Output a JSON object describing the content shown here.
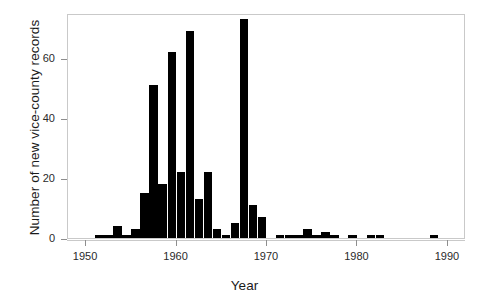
{
  "chart_data": {
    "type": "bar",
    "title": "",
    "xlabel": "Year",
    "ylabel": "Number of new vice-county records",
    "xlim": [
      1948,
      1992
    ],
    "ylim": [
      0,
      75
    ],
    "xticks": [
      1950,
      1960,
      1970,
      1980,
      1990
    ],
    "xtick_labels": [
      "1950",
      "1960",
      "1970",
      "1980",
      "1990"
    ],
    "yticks": [
      0,
      20,
      40,
      60
    ],
    "ytick_labels": [
      "0",
      "20",
      "40",
      "60"
    ],
    "grid": false,
    "legend": null,
    "bar_color": "#000000",
    "categories": [
      1951,
      1952,
      1953,
      1954,
      1955,
      1956,
      1957,
      1958,
      1959,
      1960,
      1961,
      1962,
      1963,
      1964,
      1965,
      1966,
      1967,
      1968,
      1969,
      1971,
      1972,
      1973,
      1974,
      1975,
      1976,
      1977,
      1979,
      1981,
      1982,
      1988
    ],
    "values": [
      1,
      1,
      4,
      1,
      3,
      15,
      51,
      18,
      62,
      22,
      69,
      13,
      22,
      3,
      1,
      5,
      73,
      11,
      7,
      1,
      1,
      1,
      3,
      1,
      2,
      1,
      1,
      1,
      1,
      1
    ]
  },
  "axes": {
    "y_title": "Number of new vice-county records",
    "x_title": "Year"
  }
}
